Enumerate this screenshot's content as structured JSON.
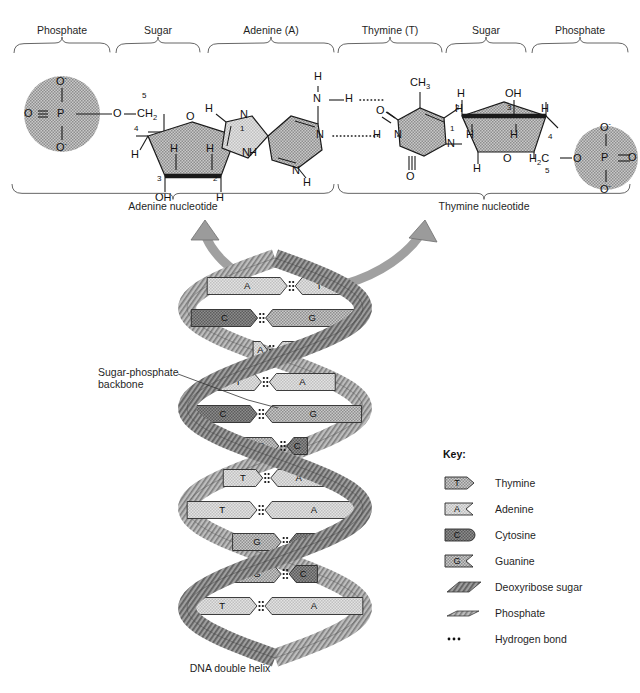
{
  "figure": {
    "caption": "DNA double helix",
    "backbone_label_line1": "Sugar-phosphate",
    "backbone_label_line2": "backbone"
  },
  "top_braces": [
    {
      "label": "Phosphate",
      "x": 14,
      "w": 96
    },
    {
      "label": "Sugar",
      "x": 116,
      "w": 84
    },
    {
      "label": "Adenine (A)",
      "x": 208,
      "w": 126
    },
    {
      "label": "Thymine (T)",
      "x": 338,
      "w": 104
    },
    {
      "label": "Sugar",
      "x": 446,
      "w": 80
    },
    {
      "label": "Phosphate",
      "x": 532,
      "w": 96
    }
  ],
  "nucleotide_braces": [
    {
      "label": "Adenine nucleotide",
      "x": 12,
      "w": 322
    },
    {
      "label": "Thymine nucleotide",
      "x": 338,
      "w": 292
    }
  ],
  "chemistry": {
    "left_phosphate": {
      "center": "P",
      "o_left": "O",
      "o_top": "O",
      "o_top_charge": "-",
      "o_bottom": "O",
      "o_bottom_charge": "-",
      "ester_o": "O",
      "ch2": "CH",
      "ch2_sub": "2",
      "ch2_number": "5"
    },
    "left_sugar": {
      "ring_o": "O",
      "numbers": [
        "1",
        "2",
        "3",
        "4"
      ],
      "h_c1": "H",
      "h_c2_top": "H",
      "h_c2_bottom": "H",
      "h_c3_top": "H",
      "oh_c3": "OH",
      "h_c4": "H"
    },
    "adenine": {
      "n_amine": "N",
      "h_amine_top": "H",
      "h_amine_right": "H",
      "n_ring_top": "N",
      "h_c8": "H",
      "n9": "N",
      "n3": "N",
      "n1": "N",
      "h_c2": "H"
    },
    "thymine": {
      "ch3": "CH",
      "ch3_sub": "3",
      "o_top": "O",
      "o_bottom": "O",
      "n1": "N",
      "n3": "N",
      "h_n3": "H",
      "h_c6": "H"
    },
    "right_sugar": {
      "ring_o": "O",
      "numbers": [
        "1",
        "2",
        "3",
        "4",
        "5"
      ],
      "h_c1_top": "H",
      "h_c1_bottom": "H",
      "h_c2": "H",
      "oh_c3": "OH",
      "h_c3": "H",
      "h_c4": "H",
      "ch2": "H",
      "ch2_sub": "2",
      "ch2_c": "C",
      "ester_o": "O"
    },
    "right_phosphate": {
      "center": "P",
      "o_right": "O",
      "o_top": "O",
      "o_top_charge": "-",
      "o_bottom": "O",
      "o_bottom_charge": "-"
    }
  },
  "helix": {
    "pairs": [
      {
        "left": "A",
        "right": "T",
        "left_long": true
      },
      {
        "left": "C",
        "right": "G",
        "left_long": false
      },
      {
        "left": "A",
        "right": "T",
        "left_long": false
      },
      {
        "left": "T",
        "right": "A",
        "left_long": false
      },
      {
        "left": "C",
        "right": "G",
        "left_long": false
      },
      {
        "left": "G",
        "right": "C",
        "left_long": true
      },
      {
        "left": "T",
        "right": "A",
        "left_long": false
      },
      {
        "left": "T",
        "right": "A",
        "left_long": false
      },
      {
        "left": "G",
        "right": "C",
        "left_long": true
      },
      {
        "left": "G",
        "right": "C",
        "left_long": true
      },
      {
        "left": "T",
        "right": "A",
        "left_long": false
      }
    ]
  },
  "key": {
    "title": "Key:",
    "items": [
      {
        "label": "Thymine",
        "glyph": "thymine-tab"
      },
      {
        "label": "Adenine",
        "glyph": "adenine-tab"
      },
      {
        "label": "Cytosine",
        "glyph": "cytosine-tab"
      },
      {
        "label": "Guanine",
        "glyph": "guanine-tab"
      },
      {
        "label": "Deoxyribose sugar",
        "glyph": "sugar-parallelogram"
      },
      {
        "label": "Phosphate",
        "glyph": "phosphate-parallelogram"
      },
      {
        "label": "Hydrogen bond",
        "glyph": "hydrogen-bond-dots"
      }
    ]
  },
  "colors": {
    "stroke": "#1a1a1a",
    "helix_fill": "#9a9a9a",
    "base_light": "#dcdcdc",
    "base_mid": "#b8b8b8",
    "base_dark": "#6e6e6e",
    "phosphate_circle": "#b5b5b5",
    "ring_fill": "#bcbcbc"
  }
}
